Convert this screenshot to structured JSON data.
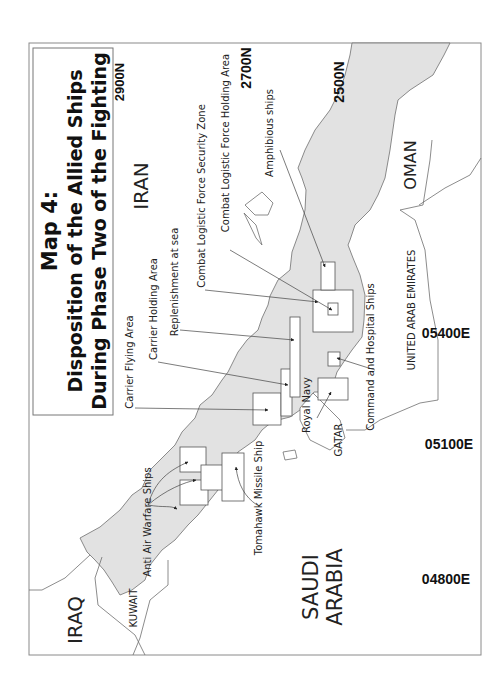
{
  "map": {
    "title_lines": [
      "Map 4:",
      "Disposition of the Allied Ships",
      "During Phase Two of the Fighting"
    ],
    "orientation": "rotated 90 degrees counterclockwise",
    "colors": {
      "water": "#e2e2e2",
      "land": "#ffffff",
      "outline": "#6e6e6e"
    },
    "countries": {
      "iran": "IRAN",
      "iraq": "IRAQ",
      "kuwait": "KUWAIT",
      "saudi_line1": "SAUDI",
      "saudi_line2": "ARABIA",
      "gatar": "GATAR",
      "uae": "UNITED ARAB EMIRATES",
      "oman": "OMAN"
    },
    "coordinates": {
      "lat_2900": "2900N",
      "lat_2700": "2700N",
      "lat_2500": "2500N",
      "lon_04800": "04800E",
      "lon_05100a": "05100E",
      "lon_05400": "05400E"
    },
    "labels": {
      "anti_air": "Anti Air Warfare Ships",
      "tomahawk": "Tomahawk Missile Ship",
      "carrier_flying": "Carrier Flying Area",
      "carrier_holding": "Carrier Holding Area",
      "replenishment": "Replenishment at sea",
      "clf_security": "Combat Logistic Force Security Zone",
      "clf_holding": "Combat Logistic Force Holding Area",
      "amphibious": "Amphibious ships",
      "royal_navy": "Royal Navy",
      "command_hospital": "Command and Hospital Ships"
    }
  }
}
